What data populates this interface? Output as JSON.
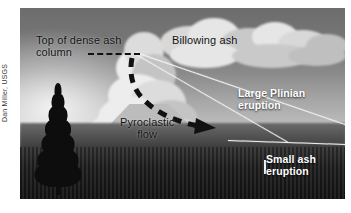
{
  "figure": {
    "credit": "Dan Miller, USGS",
    "photo_subject": "erupting-volcano-photograph"
  },
  "annotations": {
    "top_of_column": "Top of dense ash\ncolumn",
    "billowing_ash": "Billowing ash",
    "pyroclastic_flow": "Pyroclastic\nflow",
    "large_plinian": "Large Plinian\neruption",
    "small_ash": "Small ash\neruption"
  },
  "colors": {
    "label_dark": "#111111",
    "label_light": "#ffffff",
    "guide_line": "#f2f2f2",
    "dashed_arrow": "#111111",
    "page_background": "#ffffff"
  }
}
